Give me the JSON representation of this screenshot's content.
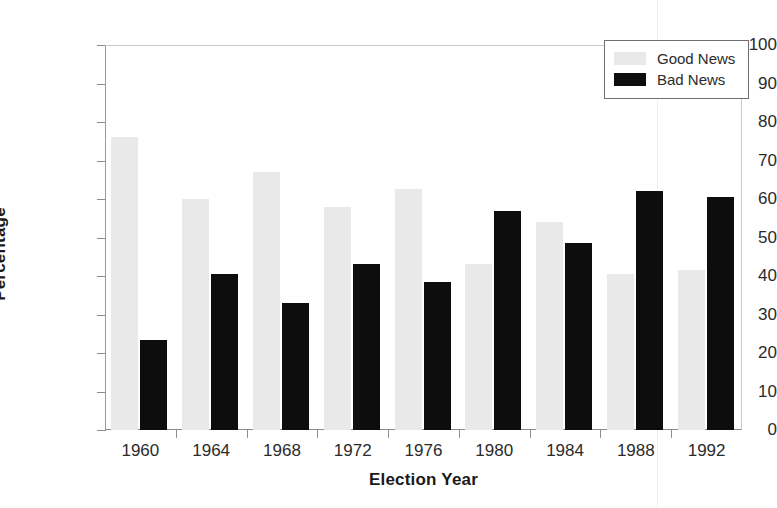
{
  "chart_data": {
    "type": "bar",
    "title": "",
    "xlabel": "Election Year",
    "ylabel": "Percentage",
    "categories": [
      "1960",
      "1964",
      "1968",
      "1972",
      "1976",
      "1980",
      "1984",
      "1988",
      "1992"
    ],
    "series": [
      {
        "name": "Good News",
        "color": "#e9e9e9",
        "values": [
          76,
          60,
          67,
          58,
          62.5,
          43,
          54,
          40.5,
          41.5
        ]
      },
      {
        "name": "Bad News",
        "color": "#0d0d0d",
        "values": [
          23.5,
          40.5,
          33,
          43,
          38.5,
          57,
          48.5,
          62,
          60.5
        ]
      }
    ],
    "ylim": [
      0,
      100
    ],
    "ytick_values": [
      0,
      10,
      20,
      30,
      40,
      50,
      60,
      70,
      80,
      90,
      100
    ],
    "ytick_labels": [
      "0",
      "10",
      "20",
      "30",
      "40",
      "50",
      "60",
      "70",
      "80",
      "90",
      "100"
    ],
    "grid": false,
    "legend_position": "top-right",
    "legend_entries": [
      "Good News",
      "Bad News"
    ]
  },
  "axes": {
    "y_title": "Percentage",
    "x_title": "Election Year"
  },
  "legend": {
    "entries": [
      {
        "label": "Good News",
        "swatch": "legend-swatch-good"
      },
      {
        "label": "Bad News",
        "swatch": "legend-swatch-bad"
      }
    ]
  }
}
